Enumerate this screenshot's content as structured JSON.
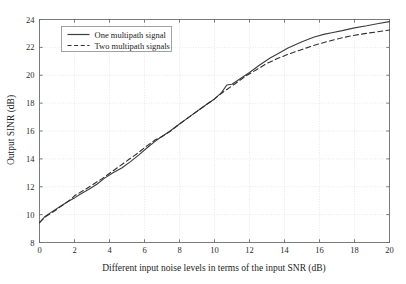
{
  "chart_data": {
    "type": "line",
    "title": "",
    "xlabel": "Different input noise levels in terms of the input SNR (dB)",
    "ylabel": "Output SINR (dB)",
    "xlim": [
      0,
      20
    ],
    "ylim": [
      8,
      24
    ],
    "xticks": [
      0,
      2,
      4,
      6,
      8,
      10,
      12,
      14,
      16,
      18,
      20
    ],
    "yticks": [
      8,
      10,
      12,
      14,
      16,
      18,
      20,
      22,
      24
    ],
    "xtick_labels": [
      "0",
      "2",
      "4",
      "6",
      "8",
      "10",
      "12",
      "14",
      "16",
      "18",
      "20"
    ],
    "ytick_labels": [
      "8",
      "10",
      "12",
      "14",
      "16",
      "18",
      "20",
      "22",
      "24"
    ],
    "grid": true,
    "legend_position": "upper-left",
    "series": [
      {
        "name": "One multipath signal",
        "style": "solid",
        "color": "#3d3d3d",
        "x": [
          0,
          0.3,
          0.7,
          1.2,
          1.7,
          2.0,
          2.3,
          2.8,
          3.3,
          3.7,
          4.2,
          4.7,
          5.2,
          5.7,
          6.2,
          6.7,
          7.0,
          7.4,
          8.0,
          8.6,
          9.2,
          9.6,
          10.0,
          10.4,
          10.7,
          11.0,
          11.4,
          12.0,
          12.6,
          13.2,
          13.7,
          14.2,
          15.0,
          15.7,
          16.3,
          16.7,
          17.3,
          18.0,
          18.7,
          19.3,
          20.0
        ],
        "y": [
          9.4,
          9.85,
          10.2,
          10.6,
          11.0,
          11.2,
          11.45,
          11.8,
          12.2,
          12.6,
          13.0,
          13.35,
          13.8,
          14.3,
          14.85,
          15.35,
          15.6,
          15.95,
          16.5,
          17.05,
          17.6,
          17.95,
          18.3,
          18.75,
          19.3,
          19.35,
          19.7,
          20.2,
          20.75,
          21.25,
          21.6,
          21.95,
          22.4,
          22.75,
          22.95,
          23.05,
          23.2,
          23.4,
          23.55,
          23.7,
          23.85
        ]
      },
      {
        "name": "Two multipath signals",
        "style": "dashed",
        "color": "#2f2f2f",
        "x": [
          0,
          0.4,
          0.9,
          1.4,
          1.8,
          2.0,
          2.2,
          2.6,
          3.1,
          3.6,
          4.1,
          4.6,
          5.1,
          5.6,
          6.1,
          6.6,
          7.0,
          7.5,
          8.0,
          8.6,
          9.1,
          9.6,
          10.0,
          10.5,
          10.9,
          11.3,
          11.8,
          12.4,
          13.0,
          13.6,
          14.2,
          15.0,
          15.7,
          16.4,
          17.0,
          17.7,
          18.4,
          19.2,
          20.0
        ],
        "y": [
          9.45,
          9.9,
          10.3,
          10.75,
          11.1,
          11.35,
          11.5,
          11.8,
          12.2,
          12.6,
          13.05,
          13.5,
          13.95,
          14.4,
          14.9,
          15.35,
          15.6,
          16.0,
          16.5,
          17.05,
          17.5,
          17.95,
          18.3,
          18.8,
          19.15,
          19.5,
          19.95,
          20.4,
          20.85,
          21.2,
          21.5,
          21.85,
          22.15,
          22.4,
          22.6,
          22.8,
          22.95,
          23.1,
          23.25
        ]
      }
    ]
  },
  "legend": {
    "entries": [
      {
        "label": "One multipath signal"
      },
      {
        "label": "Two multipath signals"
      }
    ]
  },
  "axes": {
    "x_title": "Different input noise levels in terms of the input SNR (dB)",
    "y_title": "Output SINR (dB)"
  },
  "colors": {
    "series_one": "#3d3d3d",
    "series_two": "#2f2f2f",
    "grid": "#d9d9d9",
    "frame": "#6e6e6e",
    "text": "#1d1d1d",
    "background": "#ffffff"
  }
}
